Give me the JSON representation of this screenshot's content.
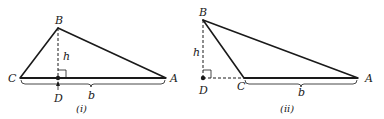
{
  "figures": [
    {
      "id": "i",
      "caption": "(i)",
      "vertices": {
        "B": "B",
        "C": "C",
        "A": "A",
        "D": "D"
      },
      "height_label": "h",
      "base_label": "b",
      "description": "Acute triangle: altitude from B meets base CA at D inside the segment"
    },
    {
      "id": "ii",
      "caption": "(ii)",
      "vertices": {
        "B": "B",
        "C": "C",
        "A": "A",
        "D": "D"
      },
      "height_label": "h",
      "base_label": "b",
      "description": "Obtuse triangle: altitude from B meets extension of base AC at D outside the segment"
    }
  ],
  "colors": {
    "ink": "#1a1a1a",
    "background": "#ffffff"
  }
}
